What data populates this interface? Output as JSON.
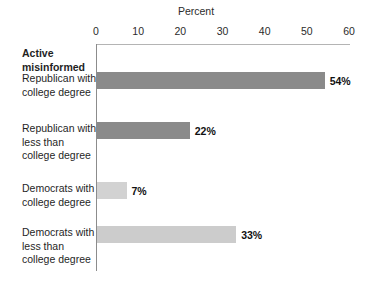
{
  "chart_data": {
    "type": "bar",
    "orientation": "horizontal",
    "title": "",
    "xlabel": "Percent",
    "ylabel": "",
    "group_header": "Active misinformed",
    "xlim": [
      0,
      60
    ],
    "xticks": [
      0,
      10,
      20,
      30,
      40,
      50,
      60
    ],
    "xtick_labels": [
      "0",
      "10",
      "20",
      "30",
      "40",
      "50",
      "60"
    ],
    "grid": false,
    "legend": "none",
    "categories": [
      "Republican with college degree",
      "Republican with less than college degree",
      "Democrats with college degree",
      "Democrats with less than college degree"
    ],
    "category_lines": [
      [
        "Republican with",
        "college degree"
      ],
      [
        "Republican with",
        "less than",
        "college degree"
      ],
      [
        "Democrats with",
        "college degree"
      ],
      [
        "Democrats with",
        "less than",
        "college degree"
      ]
    ],
    "values": [
      54,
      22,
      7,
      33
    ],
    "value_labels": [
      "54%",
      "22%",
      "7%",
      "33%"
    ],
    "bar_colors": [
      "#8a8a8a",
      "#8a8a8a",
      "#d2d2d2",
      "#cccccc"
    ],
    "colors": {
      "bar_dark": "#8a8a8a",
      "bar_light": "#d2d2d2",
      "axis_line": "#8c8c8c",
      "frame_line": "#b4b4b4",
      "text": "#1f1f1f",
      "background": "#ffffff"
    }
  }
}
